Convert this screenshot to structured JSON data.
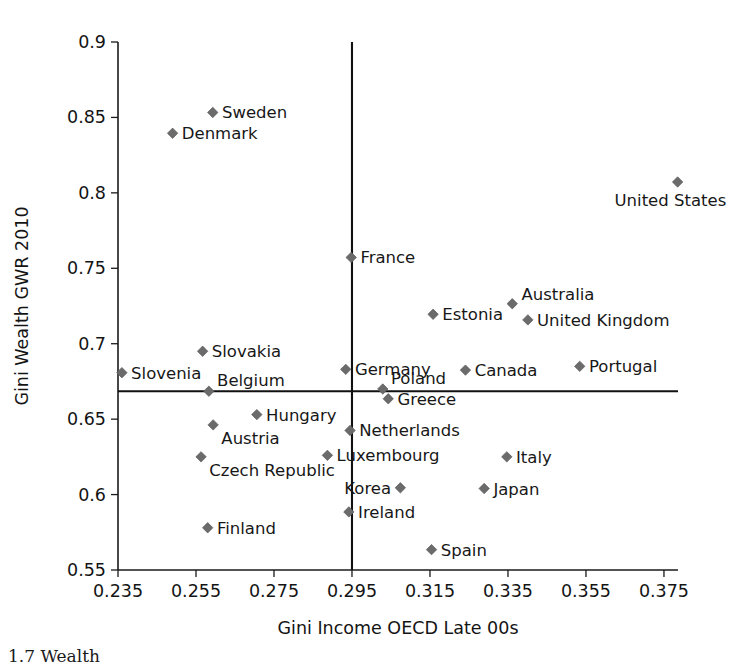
{
  "chart_data": {
    "type": "scatter",
    "title": "",
    "xlabel": "Gini Income OECD Late 00s",
    "ylabel": "Gini Wealth GWR 2010",
    "xlim": [
      0.235,
      0.3786
    ],
    "ylim": [
      0.55,
      0.9
    ],
    "xticks": [
      0.235,
      0.255,
      0.275,
      0.295,
      0.315,
      0.335,
      0.355,
      0.375
    ],
    "yticks": [
      0.55,
      0.6,
      0.65,
      0.7,
      0.75,
      0.8,
      0.85,
      0.9
    ],
    "xtick_labels": [
      "0.235",
      "0.255",
      "0.275",
      "0.295",
      "0.315",
      "0.335",
      "0.355",
      "0.375"
    ],
    "ytick_labels": [
      "0.55",
      "0.6",
      "0.65",
      "0.7",
      "0.75",
      "0.8",
      "0.85",
      "0.9"
    ],
    "grid": false,
    "legend": "none",
    "marker_color": "#6b6b6b",
    "marker_shape": "diamond",
    "reference_lines": [
      {
        "orient": "vertical",
        "value": 0.295,
        "color": "#111111"
      },
      {
        "orient": "horizontal",
        "value": 0.6685,
        "color": "#111111"
      }
    ],
    "points": [
      {
        "label": "Sweden",
        "x": 0.2593,
        "y": 0.8533,
        "label_pos": "right"
      },
      {
        "label": "Denmark",
        "x": 0.249,
        "y": 0.8395,
        "label_pos": "right"
      },
      {
        "label": "United States",
        "x": 0.3785,
        "y": 0.8072,
        "label_pos": "below-left"
      },
      {
        "label": "France",
        "x": 0.2948,
        "y": 0.7572,
        "label_pos": "right"
      },
      {
        "label": "Australia",
        "x": 0.3361,
        "y": 0.7265,
        "label_pos": "right-up"
      },
      {
        "label": "United Kingdom",
        "x": 0.3401,
        "y": 0.7158,
        "label_pos": "right"
      },
      {
        "label": "Estonia",
        "x": 0.3158,
        "y": 0.7195,
        "label_pos": "right"
      },
      {
        "label": "Slovakia",
        "x": 0.2567,
        "y": 0.695,
        "label_pos": "right"
      },
      {
        "label": "Slovenia",
        "x": 0.236,
        "y": 0.6808,
        "label_pos": "right"
      },
      {
        "label": "Germany",
        "x": 0.2934,
        "y": 0.683,
        "label_pos": "right"
      },
      {
        "label": "Canada",
        "x": 0.3241,
        "y": 0.6825,
        "label_pos": "right"
      },
      {
        "label": "Portugal",
        "x": 0.3534,
        "y": 0.685,
        "label_pos": "right"
      },
      {
        "label": "Belgium",
        "x": 0.2583,
        "y": 0.6685,
        "label_pos": "above-right"
      },
      {
        "label": "Poland",
        "x": 0.3029,
        "y": 0.67,
        "label_pos": "above-right"
      },
      {
        "label": "Greece",
        "x": 0.3043,
        "y": 0.6635,
        "label_pos": "right"
      },
      {
        "label": "Hungary",
        "x": 0.2706,
        "y": 0.653,
        "label_pos": "right"
      },
      {
        "label": "Austria",
        "x": 0.2594,
        "y": 0.6462,
        "label_pos": "below-right"
      },
      {
        "label": "Netherlands",
        "x": 0.2945,
        "y": 0.6425,
        "label_pos": "right"
      },
      {
        "label": "Czech Republic",
        "x": 0.2563,
        "y": 0.625,
        "label_pos": "below-right"
      },
      {
        "label": "Luxembourg",
        "x": 0.2887,
        "y": 0.626,
        "label_pos": "right"
      },
      {
        "label": "Italy",
        "x": 0.3347,
        "y": 0.625,
        "label_pos": "right"
      },
      {
        "label": "Korea",
        "x": 0.3074,
        "y": 0.6045,
        "label_pos": "left"
      },
      {
        "label": "Japan",
        "x": 0.3289,
        "y": 0.604,
        "label_pos": "right"
      },
      {
        "label": "Finland",
        "x": 0.258,
        "y": 0.578,
        "label_pos": "right"
      },
      {
        "label": "Ireland",
        "x": 0.2942,
        "y": 0.5885,
        "label_pos": "right"
      },
      {
        "label": "Spain",
        "x": 0.3154,
        "y": 0.5635,
        "label_pos": "right"
      }
    ]
  },
  "caption": {
    "fragment": "1.7  Wealth"
  }
}
